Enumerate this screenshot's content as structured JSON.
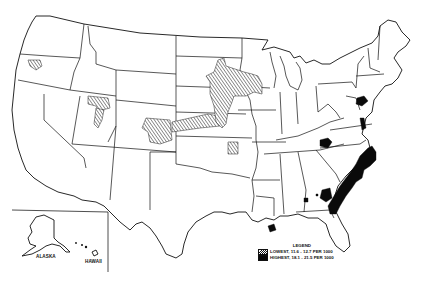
{
  "map": {
    "region": "United States",
    "insets": [
      {
        "name": "alaska",
        "label": "ALASKA"
      },
      {
        "name": "hawaii",
        "label": "HAWAII"
      }
    ]
  },
  "legend": {
    "title": "LEGEND",
    "items": [
      {
        "key": "lowest",
        "label": "LOWEST, 11.6 - 12.7 PER 1000",
        "pattern": "diagonal-hatch",
        "color": "#ffffff"
      },
      {
        "key": "highest",
        "label": "HIGHEST, 18.1 - 21.5 PER 1000",
        "pattern": "solid",
        "color": "#0a0a0a"
      }
    ]
  },
  "regions": {
    "lowest_areas": [
      "Oregon (central)",
      "Idaho/Utah border",
      "Utah (north-central)",
      "Colorado (northeast)",
      "Nebraska/Kansas",
      "Minnesota/South Dakota/Iowa",
      "Kansas/Oklahoma (east)"
    ],
    "highest_areas": [
      "Pennsylvania (central)",
      "West Virginia / Kentucky",
      "Virginia / Maryland / Delaware",
      "North Carolina",
      "South Carolina",
      "Georgia (coastal/east)",
      "Alabama (southeast)",
      "Louisiana (southeast)"
    ]
  }
}
